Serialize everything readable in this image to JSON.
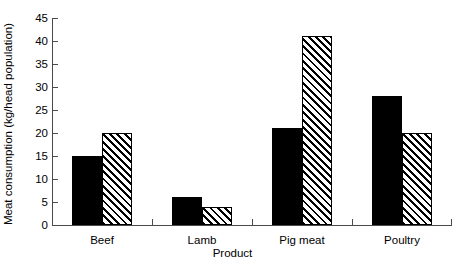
{
  "chart_data": {
    "type": "bar",
    "title": "",
    "subtitle": "",
    "xlabel": "Product",
    "ylabel": "Meat consumption (kg/head population)",
    "categories": [
      "Beef",
      "Lamb",
      "Pig meat",
      "Poultry"
    ],
    "series": [
      {
        "name": "series-solid-black",
        "fill": "solid-black",
        "values": [
          15,
          6,
          21,
          28
        ]
      },
      {
        "name": "series-diagonal-hatch",
        "fill": "diagonal-hatch",
        "values": [
          20,
          4,
          41,
          20
        ]
      }
    ],
    "ylim": [
      0,
      45
    ],
    "ytick_step": 5,
    "yticks": [
      "0",
      "5",
      "10",
      "15",
      "20",
      "25",
      "30",
      "35",
      "40",
      "45"
    ],
    "grid": false,
    "legend": "none",
    "tick_direction": "in",
    "colors": {
      "bar_solid": "#000000",
      "bar_hatch_line": "#000000",
      "bar_hatch_background": "#ffffff",
      "axis": "#4a4a4a",
      "text": "#000000",
      "background": "#ffffff"
    }
  }
}
